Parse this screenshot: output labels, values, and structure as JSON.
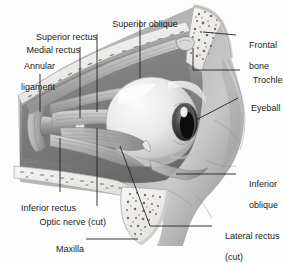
{
  "figure": {
    "type": "anatomical-illustration",
    "style": "grayscale medical illustration",
    "background_color": "#fdfdfd",
    "text_color": "#1b1b1b",
    "leader_line_color": "#222222"
  },
  "labels": {
    "superior_oblique": "Superior oblique",
    "superior_rectus": "Superior rectus",
    "medial_rectus": "Medial rectus",
    "annular_ligament_line1": "Annular",
    "annular_ligament_line2": "ligament",
    "frontal_bone_line1": "Frontal",
    "frontal_bone_line2": "bone",
    "trochlea": "Trochlea",
    "eyeball": "Eyeball",
    "inferior_oblique_line1": "Inferior",
    "inferior_oblique_line2": "oblique",
    "inferior_rectus": "Inferior rectus",
    "optic_nerve_cut": "Optic nerve (cut)",
    "maxilla": "Maxilla",
    "lateral_rectus_line1": "Lateral rectus",
    "lateral_rectus_line2": "(cut)"
  },
  "structures": [
    {
      "name": "frontal-bone",
      "description": "cancellous bone with trabecular speckle, upper right"
    },
    {
      "name": "trochlea",
      "description": "pulley of superior oblique tendon at orbital roof"
    },
    {
      "name": "superior-oblique-muscle",
      "description": "long muscle along orbital roof"
    },
    {
      "name": "superior-rectus-muscle",
      "description": "muscle above globe"
    },
    {
      "name": "medial-rectus-muscle",
      "description": "muscle medial to globe"
    },
    {
      "name": "annular-ligament",
      "description": "common tendinous ring at orbital apex"
    },
    {
      "name": "optic-nerve-cut",
      "description": "cut cylindrical nerve stub at apex"
    },
    {
      "name": "eyeball",
      "description": "globe with dark iris and pupil, highlight on cornea"
    },
    {
      "name": "inferior-rectus-muscle",
      "description": "muscle below globe"
    },
    {
      "name": "inferior-oblique-muscle",
      "description": "muscle on anterior inferior globe"
    },
    {
      "name": "lateral-rectus-cut",
      "description": "cut lateral rectus muscle belly"
    },
    {
      "name": "maxilla",
      "description": "cancellous bone with trabecular speckle, lower middle"
    }
  ],
  "palette": {
    "bone_fill": "#f2f1ef",
    "bone_edge": "#b9b7b4",
    "marrow_speckle": "#6e6c69",
    "soft_tissue_dark": "#6f6f6f",
    "soft_tissue_mid": "#9b9b9b",
    "soft_tissue_light": "#c9c9c9",
    "globe_light": "#efefef",
    "globe_shadow": "#b5b5b5",
    "iris_dark": "#1a1a1a",
    "muscle_mid": "#a9a9a9",
    "muscle_light": "#d4d4d4"
  }
}
